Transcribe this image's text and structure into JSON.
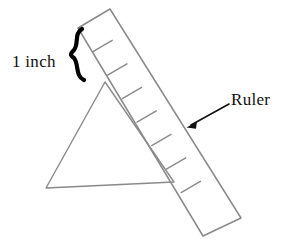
{
  "figure": {
    "title_absent": true,
    "background_color": "#ffffff",
    "stroke_color": "#8a8a8a",
    "annotation_color": "#111111",
    "brace_color": "#000000",
    "labels": {
      "inch": "1 inch",
      "ruler": "Ruler"
    },
    "objects": {
      "ruler": {
        "name": "ruler",
        "shape": "rotated-rectangle",
        "corners": [
          [
            78,
            28
          ],
          [
            110,
            9
          ],
          [
            241,
            218
          ],
          [
            203,
            236
          ]
        ],
        "tick_count": 7,
        "tick_unit": "inch"
      },
      "triangle": {
        "name": "triangle",
        "shape": "triangle",
        "vertices": [
          [
            105,
            82
          ],
          [
            46,
            188
          ],
          [
            174,
            182
          ]
        ]
      },
      "brace": {
        "name": "curly-brace",
        "orientation": "vertical",
        "span_from": [
          76,
          30
        ],
        "span_to": [
          76,
          80
        ],
        "indicates": "1 inch"
      },
      "arrow": {
        "name": "pointer-arrow",
        "from": [
          229,
          104
        ],
        "to": [
          188,
          127
        ],
        "points_to": "ruler"
      }
    }
  }
}
